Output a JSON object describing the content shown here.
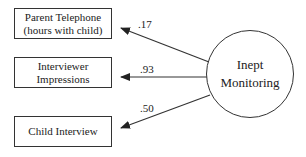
{
  "diagram": {
    "type": "measurement-model",
    "latent": {
      "line1": "Inept",
      "line2": "Monitoring"
    },
    "indicators": [
      {
        "line1": "Parent Telephone",
        "line2": "(hours with child)",
        "loading": ".17"
      },
      {
        "line1": "Interviewer",
        "line2": "Impressions",
        "loading": ".93"
      },
      {
        "line1": "Child Interview",
        "line2": "",
        "loading": ".50"
      }
    ],
    "colors": {
      "stroke": "#333333",
      "text": "#222222",
      "background": "#ffffff"
    }
  }
}
